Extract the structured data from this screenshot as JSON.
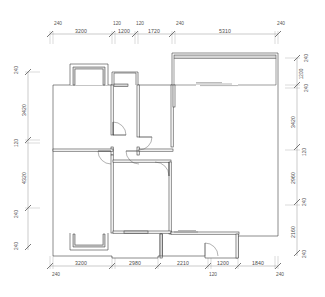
{
  "drawing": {
    "type": "architectural-floor-plan",
    "units": "mm",
    "line_color": "#2e2e2e",
    "wall_fill_color": "#d8d8d8",
    "dimension_color": "#8a8a8a",
    "background": "#ffffff"
  },
  "dimensions": {
    "top_outer": [
      {
        "label": "3200",
        "x1": 50,
        "x2": 112
      },
      {
        "label": "1200",
        "x1": 112,
        "x2": 135
      },
      {
        "label": "1720",
        "x1": 135,
        "x2": 172
      },
      {
        "label": "5310",
        "x1": 172,
        "x2": 278
      }
    ],
    "top_inner": [
      {
        "label": "240",
        "x": 52
      },
      {
        "label": "120",
        "x": 113
      },
      {
        "label": "120",
        "x": 136
      },
      {
        "label": "240",
        "x": 174
      },
      {
        "label": "240",
        "x": 277
      }
    ],
    "bottom_outer": [
      {
        "label": "3200",
        "x1": 50,
        "x2": 112
      },
      {
        "label": "2980",
        "x1": 112,
        "x2": 158
      },
      {
        "label": "2210",
        "x1": 158,
        "x2": 208
      },
      {
        "label": "1200",
        "x1": 208,
        "x2": 238
      },
      {
        "label": "1840",
        "x1": 238,
        "x2": 278
      }
    ],
    "bottom_inner": [
      {
        "label": "240",
        "x": 52
      },
      {
        "label": "120",
        "x": 210
      },
      {
        "label": "240",
        "x": 277
      }
    ],
    "left_outer": [
      {
        "label": "3420",
        "y1": 88,
        "y2": 133
      },
      {
        "label": "4320",
        "y1": 150,
        "y2": 205
      }
    ],
    "left_inner": [
      {
        "label": "240",
        "y": 74
      },
      {
        "label": "120",
        "y": 140
      },
      {
        "label": "240",
        "y": 212
      },
      {
        "label": "240",
        "y": 243
      }
    ],
    "right_outer": [
      {
        "label": "3420",
        "y1": 100,
        "y2": 145
      },
      {
        "label": "2960",
        "y1": 160,
        "y2": 198
      },
      {
        "label": "2160",
        "y1": 212,
        "y2": 248
      }
    ],
    "right_inner": [
      {
        "label": "240",
        "y": 58
      },
      {
        "label": "1200",
        "y": 72
      },
      {
        "label": "240",
        "y": 86
      },
      {
        "label": "120",
        "y": 152
      },
      {
        "label": "240",
        "y": 204
      },
      {
        "label": "240",
        "y": 256
      }
    ]
  }
}
